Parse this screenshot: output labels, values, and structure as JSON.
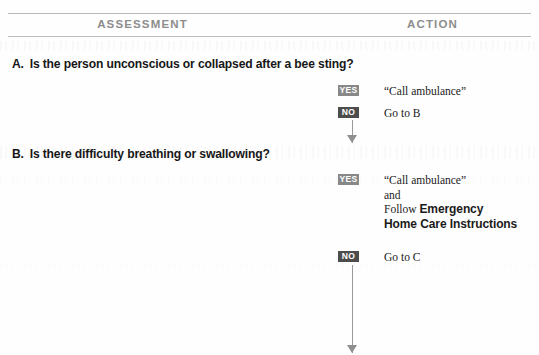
{
  "headers": {
    "assessment": "ASSESSMENT",
    "action": "ACTION"
  },
  "questions": [
    {
      "letter": "A.",
      "text": "Is the person unconscious or collapsed after a bee sting?"
    },
    {
      "letter": "B.",
      "text": "Is there difficulty breathing or swallowing?"
    }
  ],
  "actions": {
    "a_yes": {
      "badge": "YES",
      "text": "“Call ambulance”"
    },
    "a_no": {
      "badge": "NO",
      "text": "Go to B"
    },
    "b_yes": {
      "badge": "YES",
      "line1": "“Call ambulance”",
      "line2": "and",
      "line3_prefix": "Follow ",
      "line3_bold": "Emergency",
      "line4_bold": "Home Care Instructions"
    },
    "b_no": {
      "badge": "NO",
      "text": "Go to C"
    }
  },
  "colors": {
    "badge_yes": "#888888",
    "badge_no": "#4d4d4d",
    "rule": "#b9b9b9",
    "header_text": "#8d8d8d",
    "body_text": "#171717",
    "arrow": "#9a9a9a"
  }
}
